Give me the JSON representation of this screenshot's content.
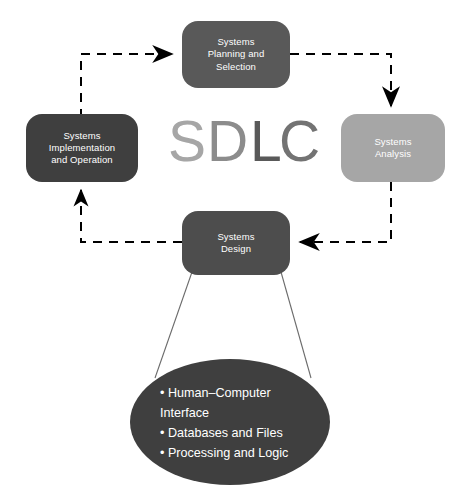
{
  "diagram": {
    "title_watermark": {
      "text": "SDLC",
      "letters": [
        {
          "char": "S",
          "color": "#a6a6a6"
        },
        {
          "char": "D",
          "color": "#8c8c8c"
        },
        {
          "char": "L",
          "color": "#595959"
        },
        {
          "char": "C",
          "color": "#737373"
        }
      ]
    },
    "nodes": [
      {
        "id": "systems-planning-and-selection",
        "label": "Systems\nPlanning and\nSelection",
        "fill": "#595959",
        "text_color": "#ffffff",
        "x": 182,
        "y": 21,
        "w": 108,
        "h": 67
      },
      {
        "id": "systems-analysis",
        "label": "Systems\nAnalysis",
        "fill": "#a6a6a6",
        "text_color": "#ffffff",
        "x": 341,
        "y": 114,
        "w": 104,
        "h": 68
      },
      {
        "id": "systems-design",
        "label": "Systems\nDesign",
        "fill": "#4d4d4d",
        "text_color": "#ffffff",
        "x": 182,
        "y": 211,
        "w": 108,
        "h": 64
      },
      {
        "id": "systems-implementation-and-operation",
        "label": "Systems\nImplementation\nand Operation",
        "fill": "#3f3f3f",
        "text_color": "#ffffff",
        "x": 26,
        "y": 114,
        "w": 112,
        "h": 68
      }
    ],
    "connectors": [
      {
        "id": "implementation-to-planning",
        "style": "dashed",
        "from": "systems-implementation-and-operation",
        "to": "systems-planning-and-selection",
        "arrow": "right"
      },
      {
        "id": "planning-to-analysis",
        "style": "dashed",
        "from": "systems-planning-and-selection",
        "to": "systems-analysis",
        "arrow": "down"
      },
      {
        "id": "analysis-to-design",
        "style": "dashed",
        "from": "systems-analysis",
        "to": "systems-design",
        "arrow": "left"
      },
      {
        "id": "design-to-implementation",
        "style": "dashed",
        "from": "systems-design",
        "to": "systems-implementation-and-operation",
        "arrow": "up"
      },
      {
        "id": "design-to-detail-left",
        "style": "solid-thin",
        "from": "systems-design",
        "to": "design-detail-ellipse"
      },
      {
        "id": "design-to-detail-right",
        "style": "solid-thin",
        "from": "systems-design",
        "to": "design-detail-ellipse"
      }
    ],
    "detail_ellipse": {
      "id": "design-detail-ellipse",
      "fill": "#3f3f3f",
      "text_color": "#ffffff",
      "cx": 230,
      "cy": 422,
      "rx": 100,
      "ry": 63,
      "items": [
        "• Human–Computer",
        "   Interface",
        "• Databases and Files",
        "• Processing and Logic"
      ],
      "items_text": "• Human–Computer\n   Interface\n• Databases and Files\n• Processing and Logic"
    },
    "colors": {
      "background": "#ffffff",
      "connector": "#000000",
      "thin_line": "#6b6b6b"
    }
  }
}
